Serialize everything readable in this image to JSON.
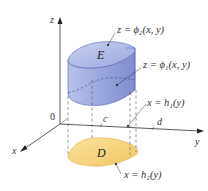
{
  "diagram": {
    "type": "3d-region-type-3-integration",
    "axes": {
      "z_label": "z",
      "x_label": "x",
      "y_label": "y",
      "origin_label": "0"
    },
    "y_ticks": {
      "c": "c",
      "d": "d"
    },
    "solid": {
      "label": "E",
      "fill_color": "#a9b4e3",
      "edge_color": "#4a5aa8"
    },
    "region": {
      "label": "D",
      "fill_color": "#f5d27a",
      "edge_color": "#e0a93a"
    },
    "annotations": {
      "top_surface": "z = ϕ₂(x, y)",
      "bottom_surface": "z = ϕ₁(x, y)",
      "back_curve": "x = h₁(y)",
      "front_curve": "x = h₂(y)"
    }
  }
}
